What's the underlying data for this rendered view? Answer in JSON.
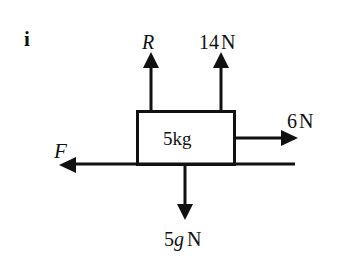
{
  "figure": {
    "part_label": "i",
    "mass_label": "5kg",
    "forces": {
      "reaction": {
        "label": "R",
        "direction": "up"
      },
      "pull_up": {
        "label": "14N",
        "value": "14",
        "unit": "N",
        "direction": "up"
      },
      "pull_right": {
        "label": "6N",
        "value": "6",
        "unit": "N",
        "direction": "right"
      },
      "friction": {
        "label": "F",
        "direction": "left"
      },
      "weight": {
        "label": "5gN",
        "value": "5g",
        "unit": "N",
        "direction": "down"
      }
    },
    "colors": {
      "stroke": "#111111",
      "background": "#ffffff"
    }
  }
}
